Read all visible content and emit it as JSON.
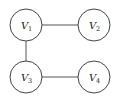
{
  "diagram": {
    "type": "undirected-graph",
    "nodes": [
      {
        "id": "V1",
        "letter": "V",
        "sub": "1",
        "cx": 26,
        "cy": 25
      },
      {
        "id": "V2",
        "letter": "V",
        "sub": "2",
        "cx": 94,
        "cy": 25
      },
      {
        "id": "V3",
        "letter": "V",
        "sub": "3",
        "cx": 26,
        "cy": 77
      },
      {
        "id": "V4",
        "letter": "V",
        "sub": "4",
        "cx": 94,
        "cy": 77
      }
    ],
    "edges": [
      {
        "from": "V1",
        "to": "V2"
      },
      {
        "from": "V1",
        "to": "V3"
      },
      {
        "from": "V3",
        "to": "V4"
      }
    ],
    "node_radius": 16
  }
}
